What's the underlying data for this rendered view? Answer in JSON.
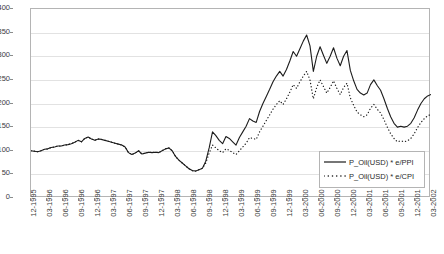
{
  "chart_data": {
    "type": "line",
    "title": "",
    "xlabel": "",
    "ylabel": "",
    "ylim": [
      0,
      400
    ],
    "ytick_step": 50,
    "yticks": [
      "400",
      "350",
      "300",
      "250",
      "200",
      "150",
      "100",
      "50",
      "0"
    ],
    "grid": true,
    "legend_position": "bottom-right-inside",
    "x": [
      "12-1995",
      "03-1996",
      "06-1996",
      "09-1996",
      "12-1996",
      "03-1997",
      "06-1997",
      "09-1997",
      "12-1997",
      "03-1998",
      "06-1998",
      "09-1998",
      "12-1998",
      "03-1999",
      "06-1999",
      "09-1999",
      "12-1999",
      "03-2000",
      "06-2000",
      "09-2000",
      "12-2000",
      "03-2001",
      "06-2001",
      "09-2001",
      "12-2001",
      "03-2002"
    ],
    "x_tick_labels": [
      "12-1995",
      "03-1996",
      "06-1996",
      "09-1996",
      "12-1996",
      "03-1997",
      "06-1997",
      "09-1997",
      "12-1997",
      "03-1998",
      "06-1998",
      "09-1998",
      "12-1998",
      "03-1999",
      "06-1999",
      "09-1999",
      "12-1999",
      "03-2000",
      "06-2000",
      "09-2000",
      "12-2000",
      "03-2001",
      "06-2001",
      "09-2001",
      "12-2001",
      "03-2002"
    ],
    "series": [
      {
        "name": "P_Oil(USD) * e/PPI",
        "style": "solid",
        "color": "#1c1c1c",
        "monthly_values": [
          100,
          99,
          98,
          100,
          103,
          104,
          107,
          108,
          110,
          110,
          112,
          113,
          115,
          118,
          122,
          119,
          126,
          129,
          125,
          122,
          125,
          124,
          122,
          120,
          118,
          116,
          114,
          112,
          108,
          96,
          92,
          95,
          100,
          93,
          95,
          97,
          96,
          97,
          96,
          100,
          104,
          106,
          100,
          88,
          80,
          74,
          68,
          62,
          58,
          57,
          60,
          63,
          78,
          106,
          140,
          132,
          122,
          115,
          130,
          126,
          119,
          112,
          128,
          140,
          152,
          168,
          163,
          160,
          183,
          200,
          215,
          230,
          246,
          258,
          268,
          258,
          272,
          290,
          310,
          300,
          316,
          332,
          345,
          322,
          268,
          300,
          320,
          302,
          285,
          300,
          318,
          296,
          280,
          300,
          312,
          270,
          248,
          230,
          222,
          218,
          222,
          240,
          250,
          238,
          228,
          210,
          190,
          172,
          158,
          150,
          152,
          150,
          152,
          158,
          170,
          186,
          200,
          210,
          216,
          219
        ],
        "key_points": {
          "start_1995_12": 100,
          "plateau_1996_1997": 110,
          "trough_1998_06": 57,
          "peak_1999_12": 345,
          "secondary_peak_2000_09": 318,
          "low_2001_12": 150,
          "end_2002_03": 219
        }
      },
      {
        "name": "P_Oil(USD) * e/CPI",
        "style": "dotted",
        "color": "#1c1c1c",
        "monthly_values": [
          100,
          99,
          98,
          100,
          103,
          104,
          107,
          108,
          110,
          110,
          112,
          113,
          115,
          118,
          122,
          119,
          126,
          129,
          125,
          122,
          125,
          124,
          122,
          120,
          118,
          116,
          114,
          112,
          108,
          96,
          92,
          95,
          100,
          93,
          95,
          97,
          96,
          97,
          96,
          100,
          104,
          106,
          100,
          88,
          80,
          74,
          68,
          62,
          58,
          57,
          60,
          63,
          74,
          95,
          112,
          106,
          100,
          96,
          104,
          101,
          96,
          92,
          100,
          108,
          116,
          128,
          126,
          124,
          140,
          152,
          164,
          176,
          188,
          198,
          206,
          198,
          210,
          224,
          240,
          232,
          246,
          258,
          268,
          250,
          210,
          234,
          250,
          236,
          222,
          234,
          248,
          232,
          219,
          234,
          243,
          212,
          196,
          182,
          176,
          172,
          176,
          190,
          198,
          188,
          180,
          166,
          150,
          136,
          126,
          119,
          121,
          119,
          121,
          126,
          136,
          149,
          160,
          168,
          174,
          177
        ],
        "key_points": {
          "start_1995_12": 100,
          "plateau_1996_1997": 110,
          "trough_1998_06": 57,
          "peak_1999_12": 268,
          "secondary_peak_2000_09": 248,
          "low_2001_12": 119,
          "end_2002_03": 177
        }
      }
    ]
  },
  "legend": {
    "entries": [
      {
        "label": "P_Oil(USD) * e/PPI",
        "style": "solid"
      },
      {
        "label": "P_Oil(USD) * e/CPI",
        "style": "dotted"
      }
    ]
  },
  "colors": {
    "series_line": "#1c1c1c",
    "grid": "#e2e2e2",
    "frame": "#b4b4b4",
    "text": "#3b3b3b",
    "background": "#ffffff"
  }
}
